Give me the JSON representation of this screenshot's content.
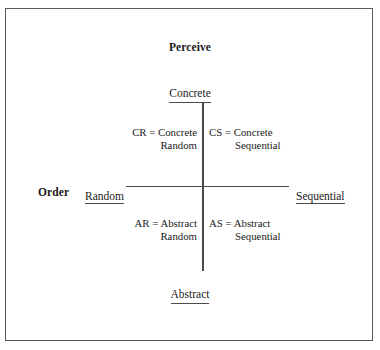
{
  "figure": {
    "perceive_heading": "Perceive",
    "order_heading": "Order",
    "poles": {
      "top": "Concrete",
      "bottom": "Abstract",
      "left": "Random",
      "right": "Sequential"
    },
    "quadrants": [
      {
        "code": "CR",
        "line1": "CR = Concrete",
        "line2": "Random",
        "position": "top-left"
      },
      {
        "code": "CS",
        "line1": "CS = Concrete",
        "line2": "Sequential",
        "position": "top-right"
      },
      {
        "code": "AR",
        "line1": "AR = Abstract",
        "line2": "Random",
        "position": "bottom-left"
      },
      {
        "code": "AS",
        "line1": "AS = Abstract",
        "line2": "Sequential",
        "position": "bottom-right"
      }
    ],
    "colors": {
      "border": "#5a5a5a",
      "axis": "#4a4a4a",
      "text": "#1a1a1a",
      "background": "#ffffff"
    }
  }
}
